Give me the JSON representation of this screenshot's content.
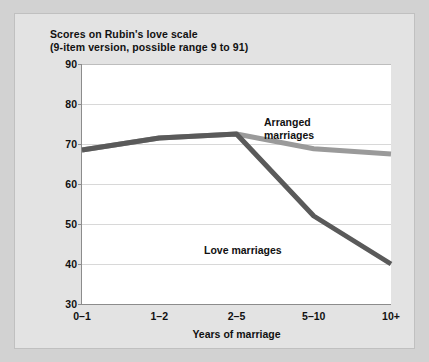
{
  "figure": {
    "title_line1": "Scores on Rubin's love scale",
    "title_line2": "(9-item version, possible range 9 to 91)",
    "background_color": "#e3e3e3",
    "page_background_color": "#d2d2d2",
    "plot_background_color": "#ffffff"
  },
  "chart_data": {
    "type": "line",
    "title": "Scores on Rubin's love scale (9-item version, possible range 9 to 91)",
    "xlabel": "Years of marriage",
    "ylabel": "",
    "categories": [
      "0–1",
      "1–2",
      "2–5",
      "5–10",
      "10+"
    ],
    "ylim": [
      30,
      90
    ],
    "yticks": [
      30,
      40,
      50,
      60,
      70,
      80,
      90
    ],
    "grid": true,
    "legend": "inline-annotations",
    "series": [
      {
        "name": "Arranged marriages",
        "color": "#6e6e6e",
        "values": [
          68.5,
          71.5,
          72.5,
          68.8,
          67.5
        ]
      },
      {
        "name": "Love marriages",
        "color": "#4d4d4d",
        "values": [
          68.5,
          71.5,
          72.5,
          52.0,
          40.0
        ]
      }
    ],
    "annotations": [
      {
        "text_line1": "Arranged",
        "text_line2": "marriages",
        "series": "Arranged marriages"
      },
      {
        "text_line1": "Love marriages",
        "text_line2": "",
        "series": "Love marriages"
      }
    ]
  },
  "axis": {
    "y_tick_labels": [
      "90",
      "80",
      "70",
      "60",
      "50",
      "40",
      "30"
    ],
    "x_tick_labels": [
      "0–1",
      "1–2",
      "2–5",
      "5–10",
      "10+"
    ],
    "x_axis_title": "Years of marriage"
  },
  "annotations": {
    "arranged_line1": "Arranged",
    "arranged_line2": "marriages",
    "love_line1": "Love marriages"
  }
}
